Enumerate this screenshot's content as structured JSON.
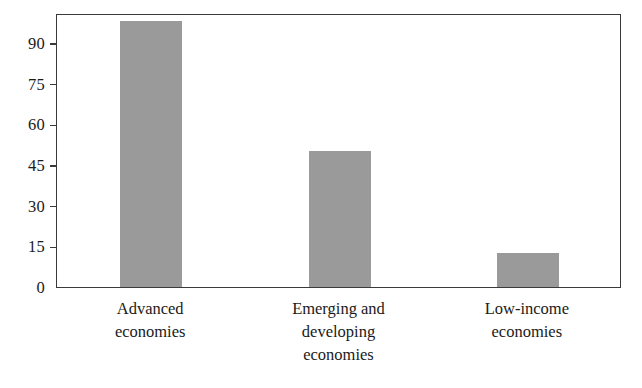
{
  "chart_data": {
    "type": "bar",
    "title": "",
    "subtitle": "",
    "xlabel": "",
    "ylabel": "",
    "categories": [
      "Advanced economies",
      "Emerging and developing economies",
      "Low-income economies"
    ],
    "category_label_lines": [
      [
        "Advanced",
        "economies"
      ],
      [
        "Emerging and",
        "developing",
        "economies"
      ],
      [
        "Low-income",
        "economies"
      ]
    ],
    "values": [
      98,
      50,
      12.5
    ],
    "ylim": [
      0,
      101
    ],
    "yticks": [
      0,
      15,
      30,
      45,
      60,
      75,
      90
    ],
    "ytick_labels": [
      "0",
      "15",
      "30",
      "45",
      "60",
      "75",
      "90"
    ],
    "grid": false,
    "legend": null,
    "bar_color": "#9a9a9a",
    "axis_color": "#3a3a3a",
    "background_color": "#ffffff"
  }
}
